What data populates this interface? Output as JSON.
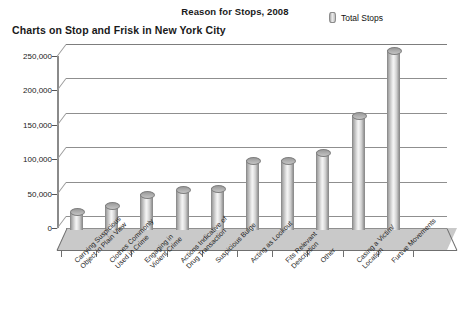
{
  "titles": {
    "main": "Reason for Stops, 2008",
    "sub": "Charts on Stop and Frisk in New York City"
  },
  "legend": {
    "series_label": "Total Stops",
    "swatch_name": "cylinder-swatch"
  },
  "chart_data": {
    "type": "bar",
    "title": "Reason for Stops, 2008",
    "subtitle": "Charts on Stop and Frisk in New York City",
    "xlabel": "",
    "ylabel": "",
    "ylim": [
      0,
      250000
    ],
    "ytick_values": [
      0,
      50000,
      100000,
      150000,
      200000,
      250000
    ],
    "ytick_labels": [
      "0",
      "50,000",
      "100,000",
      "150,000",
      "200,000",
      "250,000"
    ],
    "grid": true,
    "legend_position": "top-right",
    "style": "3d-cylinder",
    "categories": [
      "Carrying Suspicious Object in Plain View",
      "Clothes Commonly Used in Crime",
      "Engaging in Violent Crime",
      "Actions Indicative of Drug Transaction",
      "Suspicious Bulge",
      "Acting as Lookout",
      "Fits Relevant Description",
      "Other",
      "Casing a Victim/ Location",
      "Furtive Movements"
    ],
    "category_lines": [
      [
        "Carrying Suspicious",
        "Object in Plain View"
      ],
      [
        "Clothes Commonly",
        "Used in Crime"
      ],
      [
        "Engaging in",
        "Violent Crime"
      ],
      [
        "Actions Indicative of",
        "Drug Transaction"
      ],
      [
        "Suspicious Bulge"
      ],
      [
        "Acting as Lookout"
      ],
      [
        "Fits Relevant",
        "Description"
      ],
      [
        "Other"
      ],
      [
        "Casing a Victim/",
        "Location"
      ],
      [
        "Furtive Movements"
      ]
    ],
    "series": [
      {
        "name": "Total Stops",
        "values": [
          18000,
          27000,
          43000,
          50000,
          52000,
          93000,
          93000,
          105000,
          158000,
          253000
        ]
      }
    ]
  }
}
